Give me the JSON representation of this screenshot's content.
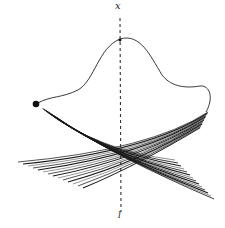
{
  "diagram": {
    "title": "",
    "axis": {
      "label_top": "x",
      "label_bottom": "l",
      "style": "dashed-vertical"
    },
    "annotations": {
      "near_peak_mark": "·"
    },
    "elements": {
      "curve": "single smooth curve rising from left dot to a peak on the axis, then descending and flattening to the right",
      "start_point": "filled black dot at left end of curve",
      "fan_left": "bundle of strokes sweeping from upper-left down to the lower-right",
      "fan_right": "bundle of strokes sweeping from upper-right down to the lower-left",
      "crossing": "dense crossing region of the two bundles, centered on the axis"
    },
    "colors": {
      "ink": "#1a1a1a",
      "background": "#ffffff"
    }
  }
}
